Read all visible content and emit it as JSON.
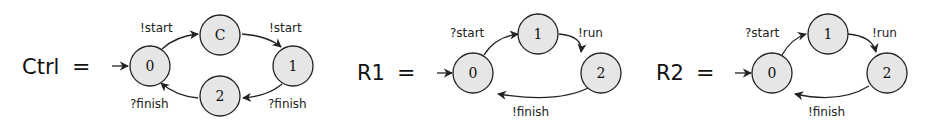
{
  "automata": [
    {
      "name": "Ctrl",
      "equals": "=",
      "states": [
        {
          "id": "0",
          "label": "0",
          "initial": true
        },
        {
          "id": "C",
          "label": "C"
        },
        {
          "id": "1",
          "label": "1"
        },
        {
          "id": "2",
          "label": "2"
        }
      ],
      "transitions": [
        {
          "from": "0",
          "to": "C",
          "label": "!start"
        },
        {
          "from": "C",
          "to": "1",
          "label": "!start"
        },
        {
          "from": "1",
          "to": "2",
          "label": "?finish"
        },
        {
          "from": "2",
          "to": "0",
          "label": "?finish"
        }
      ]
    },
    {
      "name": "R1",
      "equals": "=",
      "states": [
        {
          "id": "0",
          "label": "0",
          "initial": true
        },
        {
          "id": "1",
          "label": "1"
        },
        {
          "id": "2",
          "label": "2"
        }
      ],
      "transitions": [
        {
          "from": "0",
          "to": "1",
          "label": "?start"
        },
        {
          "from": "1",
          "to": "2",
          "label": "!run"
        },
        {
          "from": "2",
          "to": "0",
          "label": "!finish"
        }
      ]
    },
    {
      "name": "R2",
      "equals": "=",
      "states": [
        {
          "id": "0",
          "label": "0",
          "initial": true
        },
        {
          "id": "1",
          "label": "1"
        },
        {
          "id": "2",
          "label": "2"
        }
      ],
      "transitions": [
        {
          "from": "0",
          "to": "1",
          "label": "?start"
        },
        {
          "from": "1",
          "to": "2",
          "label": "!run"
        },
        {
          "from": "2",
          "to": "0",
          "label": "!finish"
        }
      ]
    }
  ],
  "colors": {
    "node_fill": "#e6e6e6",
    "stroke": "#222222",
    "background": "#ffffff"
  }
}
